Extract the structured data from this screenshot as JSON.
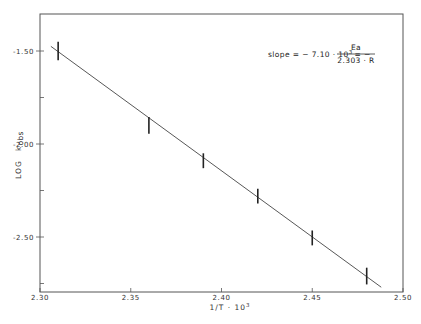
{
  "chart_data": {
    "type": "scatter",
    "title": "",
    "xlabel": "1/T · 10³",
    "ylabel": "LOG k_obs",
    "ylabel_main": "LOG",
    "ylabel_sub": "k",
    "ylabel_subscript": "obs",
    "xlim": [
      2.3,
      2.5
    ],
    "ylim": [
      -2.8,
      -1.3
    ],
    "grid": false,
    "legend": null,
    "x_ticks": [
      2.3,
      2.35,
      2.4,
      2.45,
      2.5
    ],
    "x_tick_labels": [
      "2.30",
      "2.35",
      "2.40",
      "2.45",
      "2.50"
    ],
    "y_ticks": [
      -1.5,
      -2.0,
      -2.5
    ],
    "y_tick_labels": [
      "-1.50",
      "-2.00",
      "-2.50"
    ],
    "y_minor_ticks": [
      -1.75,
      -2.25,
      -2.75
    ],
    "series": [
      {
        "name": "measured",
        "style": "error_bars",
        "x": [
          2.31,
          2.36,
          2.39,
          2.42,
          2.45,
          2.48
        ],
        "y": [
          -1.5,
          -1.9,
          -2.09,
          -2.28,
          -2.505,
          -2.71
        ],
        "error": [
          0.05,
          0.045,
          0.04,
          0.04,
          0.04,
          0.045
        ]
      },
      {
        "name": "linear fit",
        "style": "line",
        "x": [
          2.306,
          2.488
        ],
        "y": [
          -1.475,
          -2.77
        ]
      }
    ],
    "annotations": [
      {
        "text": "slope = − 7.10 · 10³ = − Ea / (2.303 · R)",
        "lhs": "slope = − 7.10 · 10",
        "exp": "3",
        "mid": "= −",
        "numerator": "Ea",
        "denominator": "2.303 · R"
      }
    ]
  }
}
